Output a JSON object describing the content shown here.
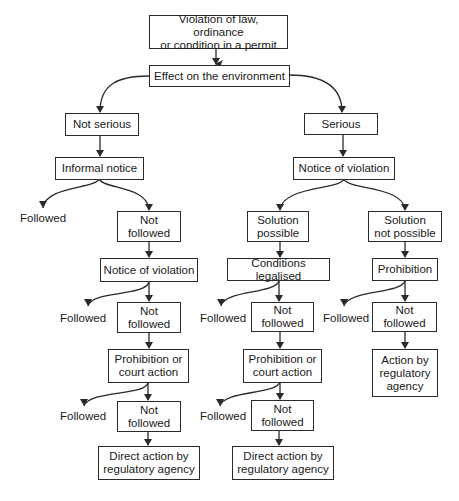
{
  "diagram": {
    "type": "flowchart",
    "root": {
      "violation": "Violation of law, ordinance\nor condition in a permit",
      "effect": "Effect on the environment"
    },
    "left_branch": {
      "not_serious": "Not serious",
      "informal_notice": "Informal notice",
      "followed_1": "Followed",
      "not_followed_1": "Not\nfollowed",
      "notice_of_violation": "Notice of violation",
      "followed_2": "Followed",
      "not_followed_2": "Not\nfollowed",
      "prohibition_or_court": "Prohibition or\ncourt action",
      "followed_3": "Followed",
      "not_followed_3": "Not\nfollowed",
      "direct_action": "Direct action by\nregulatory agency"
    },
    "right_branch": {
      "serious": "Serious",
      "notice_of_violation": "Notice of violation",
      "solution_possible": {
        "label": "Solution\npossible",
        "conditions_legalised": "Conditions legalised",
        "followed_1": "Followed",
        "not_followed_1": "Not\nfollowed",
        "prohibition_or_court": "Prohibition or\ncourt action",
        "followed_2": "Followed",
        "not_followed_2": "Not\nfollowed",
        "direct_action": "Direct action by\nregulatory agency"
      },
      "solution_not_possible": {
        "label": "Solution\nnot possible",
        "prohibition": "Prohibition",
        "followed_1": "Followed",
        "not_followed_1": "Not\nfollowed",
        "action_by_agency": "Action by\nregulatory\nagency"
      }
    },
    "colors": {
      "stroke": "#2a2a2a",
      "text": "#1a1a1a",
      "background": "#ffffff"
    }
  }
}
